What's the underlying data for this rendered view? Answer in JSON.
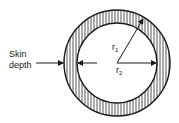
{
  "diagram": {
    "skin_label_line1": "Skin",
    "skin_label_line2": "depth",
    "r1_label": "r",
    "r1_sub": "1",
    "r2_label": "r",
    "r2_sub": "2",
    "colors": {
      "stroke": "#1a1a1a",
      "hatch": "#2a2a2a",
      "background": "#ffffff"
    }
  }
}
